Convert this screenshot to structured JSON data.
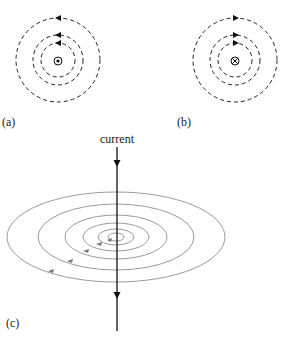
{
  "figure": {
    "panel_a": {
      "label": "(a)",
      "center_symbol": "dot-in-circle (current out of page)",
      "arrow_direction": "counterclockwise (left at top)"
    },
    "panel_b": {
      "label": "(b)",
      "center_symbol": "cross-in-circle (current into page)",
      "arrow_direction": "clockwise (right at top)"
    },
    "panel_c": {
      "label": "(c)",
      "current_label": "current",
      "current_direction": "down"
    }
  },
  "colors": {
    "dashed_lines": "#222222",
    "ellipse_lines": "#9a9a9a",
    "current_line": "#111111",
    "text": "#222222"
  }
}
